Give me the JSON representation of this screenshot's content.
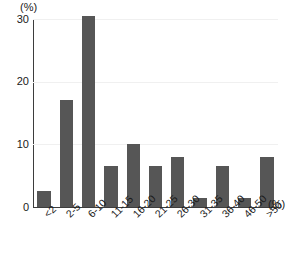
{
  "chart_data": {
    "type": "bar",
    "title": "",
    "xlabel": "(%)",
    "ylabel": "(%)",
    "y_unit_caption": "(%)",
    "x_unit_caption": "(%)",
    "categories": [
      "<2",
      "2-5",
      "6-10",
      "11-15",
      "16-20",
      "21-25",
      "26-30",
      "31-35",
      "36-40",
      "46-50",
      ">50"
    ],
    "values": [
      2.5,
      17,
      30.5,
      6.5,
      10,
      6.5,
      8,
      1.5,
      6.5,
      1.5,
      8
    ],
    "ylim": [
      0,
      30
    ],
    "yticks": [
      0,
      10,
      20,
      30
    ],
    "ytick_labels": [
      "0",
      "10",
      "20",
      "30"
    ],
    "grid": "horizontal",
    "legend": "none",
    "bar_color": "#565656",
    "axis_color": "#3d3d3d",
    "grid_color": "#f0f0f0",
    "background": "#ffffff"
  }
}
